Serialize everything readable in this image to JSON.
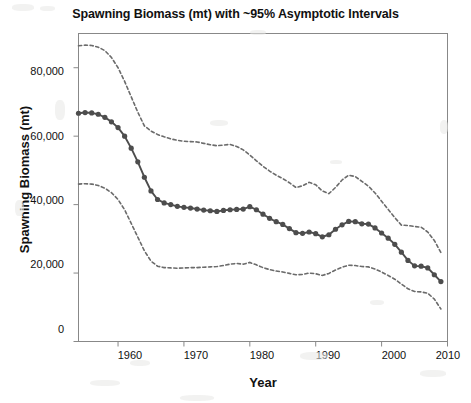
{
  "chart_data": {
    "type": "line",
    "title": "Spawning Biomass (mt) with ~95% Asymptotic Intervals",
    "xlabel": "Year",
    "ylabel": "Spawning Biomass (mt)",
    "xlim": [
      1954,
      2010
    ],
    "ylim": [
      0,
      90000
    ],
    "xticks": [
      1960,
      1970,
      1980,
      1990,
      2000,
      2010
    ],
    "xticklabels": [
      "1960",
      "1970",
      "1980",
      "1990",
      "2000",
      "2010"
    ],
    "yticks": [
      0,
      20000,
      40000,
      60000,
      80000
    ],
    "yticklabels": [
      "0",
      "20,000",
      "40,000",
      "60,000",
      "80,000"
    ],
    "grid": false,
    "legend": "none",
    "line_color": "#555555",
    "marker": "filled-circle",
    "ci_style": "dashed",
    "x": [
      1954,
      1955,
      1956,
      1957,
      1958,
      1959,
      1960,
      1961,
      1962,
      1963,
      1964,
      1965,
      1966,
      1967,
      1968,
      1969,
      1970,
      1971,
      1972,
      1973,
      1974,
      1975,
      1976,
      1977,
      1978,
      1979,
      1980,
      1981,
      1982,
      1983,
      1984,
      1985,
      1986,
      1987,
      1988,
      1989,
      1990,
      1991,
      1992,
      1993,
      1994,
      1995,
      1996,
      1997,
      1998,
      1999,
      2000,
      2001,
      2002,
      2003,
      2004,
      2005,
      2006,
      2007,
      2008,
      2009
    ],
    "series": [
      {
        "name": "Spawning biomass (point estimate)",
        "values": [
          66700,
          66900,
          66800,
          66400,
          65500,
          64200,
          62500,
          60000,
          56500,
          52500,
          48000,
          44000,
          41500,
          40500,
          40000,
          39500,
          39200,
          39000,
          38700,
          38400,
          38200,
          38000,
          38300,
          38500,
          38600,
          38700,
          39400,
          38500,
          37200,
          36000,
          35000,
          34200,
          33000,
          31800,
          31600,
          32000,
          31500,
          30600,
          31200,
          32800,
          34100,
          35100,
          35000,
          34400,
          34300,
          33200,
          31700,
          30200,
          28400,
          26100,
          23700,
          22100,
          22000,
          21500,
          19500,
          17500
        ]
      },
      {
        "name": "Upper ~95% asymptotic interval",
        "values": [
          86400,
          86600,
          86500,
          86000,
          85000,
          83000,
          80000,
          76000,
          71500,
          67000,
          63000,
          61500,
          60500,
          59800,
          59200,
          58800,
          58500,
          58400,
          58300,
          57900,
          57500,
          57200,
          57400,
          57600,
          57000,
          56000,
          54500,
          52800,
          51200,
          49800,
          48600,
          47600,
          46400,
          45000,
          45500,
          46500,
          45800,
          44000,
          43200,
          45000,
          47200,
          48600,
          48200,
          46800,
          45400,
          43400,
          41000,
          38600,
          36200,
          34000,
          33900,
          33600,
          33400,
          32000,
          29500,
          26000
        ]
      },
      {
        "name": "Lower ~95% asymptotic interval",
        "values": [
          46000,
          46100,
          46000,
          45600,
          44800,
          43500,
          41500,
          38500,
          34500,
          30500,
          26500,
          23500,
          22000,
          21600,
          21500,
          21400,
          21500,
          21600,
          21600,
          21700,
          21800,
          21900,
          22200,
          22600,
          22800,
          22600,
          23100,
          22400,
          21600,
          21000,
          20600,
          20300,
          19900,
          19500,
          19600,
          20000,
          19800,
          19300,
          19900,
          20900,
          21700,
          22300,
          22200,
          21900,
          21800,
          21200,
          20300,
          19300,
          18200,
          16800,
          15400,
          14600,
          14500,
          14100,
          12400,
          9500
        ]
      }
    ]
  }
}
